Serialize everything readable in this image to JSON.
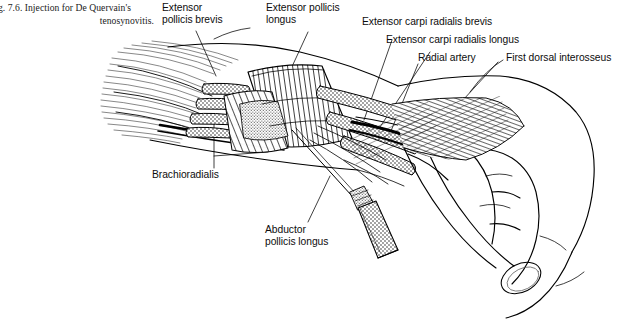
{
  "figure": {
    "caption_line1": "g. 7.6. Injection for De Quervain's",
    "caption_line2": "tenosynovitis.",
    "background_color": "#ffffff",
    "ink_color": "#000000"
  },
  "labels": {
    "extensor_pollicis_brevis": "Extensor\npollicis brevis",
    "extensor_pollicis_longus": "Extensor pollicis\nlongus",
    "extensor_carpi_radialis_brevis": "Extensor carpi radialis brevis",
    "extensor_carpi_radialis_longus": "Extensor carpi radialis longus",
    "radial_artery": "Radial artery",
    "first_dorsal_interosseus": "First dorsal interosseus",
    "brachioradialis": "Brachioradialis",
    "abductor_pollicis_longus": "Abductor\npollicis longus"
  },
  "illustration": {
    "subject": "dorsal-radial wrist and hand, line drawing",
    "view": "dorsoradial oblique",
    "structures": [
      "forearm muscle bellies with parallel fibre hatching",
      "stippled extensor tendons crossing the wrist",
      "striped extensor retinaculum band",
      "radial artery drawn as heavy black lines",
      "first dorsal interosseus with fine hatching",
      "thumb and index finger of relaxed hand with thumbnail",
      "hypodermic syringe with needle entering first extensor compartment"
    ]
  }
}
